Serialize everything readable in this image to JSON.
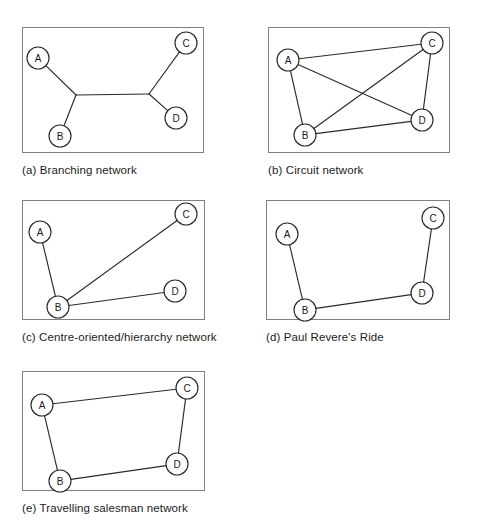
{
  "figure": {
    "width": 482,
    "height": 524,
    "background": "#ffffff",
    "line_color": "#2b2b2b",
    "frame_color": "#808080",
    "node_fill": "#ffffff",
    "node_radius": 11
  },
  "panels": [
    {
      "id": "a",
      "caption": "(a) Branching network",
      "frame": {
        "x": 22,
        "y": 27,
        "w": 182,
        "h": 126
      },
      "caption_pos": {
        "x": 22,
        "y": 163
      },
      "nodes": [
        {
          "label": "A",
          "x": 38,
          "y": 58
        },
        {
          "label": "B",
          "x": 60,
          "y": 136
        },
        {
          "label": "C",
          "x": 186,
          "y": 43
        },
        {
          "label": "D",
          "x": 176,
          "y": 118
        }
      ],
      "junctions": [
        {
          "id": "j1",
          "x": 76,
          "y": 95
        },
        {
          "id": "j2",
          "x": 149,
          "y": 94
        }
      ],
      "edges": [
        {
          "from": "A",
          "to": "j1"
        },
        {
          "from": "B",
          "to": "j1"
        },
        {
          "from": "j1",
          "to": "j2"
        },
        {
          "from": "C",
          "to": "j2"
        },
        {
          "from": "D",
          "to": "j2"
        }
      ]
    },
    {
      "id": "b",
      "caption": "(b) Circuit network",
      "frame": {
        "x": 268,
        "y": 27,
        "w": 182,
        "h": 126
      },
      "caption_pos": {
        "x": 268,
        "y": 163
      },
      "nodes": [
        {
          "label": "A",
          "x": 288,
          "y": 60
        },
        {
          "label": "B",
          "x": 305,
          "y": 135
        },
        {
          "label": "C",
          "x": 432,
          "y": 43
        },
        {
          "label": "D",
          "x": 422,
          "y": 120
        }
      ],
      "junctions": [],
      "edges": [
        {
          "from": "A",
          "to": "B"
        },
        {
          "from": "A",
          "to": "C"
        },
        {
          "from": "A",
          "to": "D"
        },
        {
          "from": "B",
          "to": "C"
        },
        {
          "from": "B",
          "to": "D"
        },
        {
          "from": "C",
          "to": "D"
        }
      ]
    },
    {
      "id": "c",
      "caption": "(c) Centre-oriented/hierarchy network",
      "frame": {
        "x": 22,
        "y": 200,
        "w": 183,
        "h": 120
      },
      "caption_pos": {
        "x": 22,
        "y": 330
      },
      "nodes": [
        {
          "label": "A",
          "x": 40,
          "y": 232
        },
        {
          "label": "B",
          "x": 58,
          "y": 307
        },
        {
          "label": "C",
          "x": 186,
          "y": 214
        },
        {
          "label": "D",
          "x": 175,
          "y": 291
        }
      ],
      "junctions": [],
      "edges": [
        {
          "from": "B",
          "to": "A"
        },
        {
          "from": "B",
          "to": "C"
        },
        {
          "from": "B",
          "to": "D"
        }
      ]
    },
    {
      "id": "d",
      "caption": "(d) Paul Revere's Ride",
      "frame": {
        "x": 266,
        "y": 200,
        "w": 184,
        "h": 120
      },
      "caption_pos": {
        "x": 266,
        "y": 330
      },
      "nodes": [
        {
          "label": "A",
          "x": 287,
          "y": 234
        },
        {
          "label": "B",
          "x": 305,
          "y": 310
        },
        {
          "label": "C",
          "x": 433,
          "y": 218
        },
        {
          "label": "D",
          "x": 422,
          "y": 293
        }
      ],
      "junctions": [],
      "edges": [
        {
          "from": "A",
          "to": "B"
        },
        {
          "from": "B",
          "to": "D"
        },
        {
          "from": "D",
          "to": "C"
        }
      ]
    },
    {
      "id": "e",
      "caption": "(e) Travelling salesman network",
      "frame": {
        "x": 22,
        "y": 371,
        "w": 183,
        "h": 120
      },
      "caption_pos": {
        "x": 22,
        "y": 501
      },
      "nodes": [
        {
          "label": "A",
          "x": 42,
          "y": 405
        },
        {
          "label": "B",
          "x": 60,
          "y": 481
        },
        {
          "label": "C",
          "x": 187,
          "y": 388
        },
        {
          "label": "D",
          "x": 177,
          "y": 464
        }
      ],
      "junctions": [],
      "edges": [
        {
          "from": "A",
          "to": "C"
        },
        {
          "from": "C",
          "to": "D"
        },
        {
          "from": "D",
          "to": "B"
        },
        {
          "from": "B",
          "to": "A"
        }
      ]
    }
  ],
  "chart_data": {
    "type": "diagram",
    "graphs": [
      {
        "name": "Branching network",
        "nodes": [
          "A",
          "B",
          "C",
          "D"
        ],
        "edges": [
          [
            "A",
            "j1"
          ],
          [
            "B",
            "j1"
          ],
          [
            "j1",
            "j2"
          ],
          [
            "C",
            "j2"
          ],
          [
            "D",
            "j2"
          ]
        ],
        "degree": {
          "A": 1,
          "B": 1,
          "C": 1,
          "D": 1
        },
        "edge_count": 5
      },
      {
        "name": "Circuit network",
        "nodes": [
          "A",
          "B",
          "C",
          "D"
        ],
        "edges": [
          [
            "A",
            "B"
          ],
          [
            "A",
            "C"
          ],
          [
            "A",
            "D"
          ],
          [
            "B",
            "C"
          ],
          [
            "B",
            "D"
          ],
          [
            "C",
            "D"
          ]
        ],
        "degree": {
          "A": 3,
          "B": 3,
          "C": 3,
          "D": 3
        },
        "edge_count": 6
      },
      {
        "name": "Centre-oriented/hierarchy network",
        "nodes": [
          "A",
          "B",
          "C",
          "D"
        ],
        "edges": [
          [
            "B",
            "A"
          ],
          [
            "B",
            "C"
          ],
          [
            "B",
            "D"
          ]
        ],
        "degree": {
          "A": 1,
          "B": 3,
          "C": 1,
          "D": 1
        },
        "edge_count": 3
      },
      {
        "name": "Paul Revere's Ride",
        "nodes": [
          "A",
          "B",
          "C",
          "D"
        ],
        "edges": [
          [
            "A",
            "B"
          ],
          [
            "B",
            "D"
          ],
          [
            "D",
            "C"
          ]
        ],
        "degree": {
          "A": 1,
          "B": 2,
          "C": 1,
          "D": 2
        },
        "edge_count": 3
      },
      {
        "name": "Travelling salesman network",
        "nodes": [
          "A",
          "B",
          "C",
          "D"
        ],
        "edges": [
          [
            "A",
            "C"
          ],
          [
            "C",
            "D"
          ],
          [
            "D",
            "B"
          ],
          [
            "B",
            "A"
          ]
        ],
        "degree": {
          "A": 2,
          "B": 2,
          "C": 2,
          "D": 2
        },
        "edge_count": 4
      }
    ]
  }
}
